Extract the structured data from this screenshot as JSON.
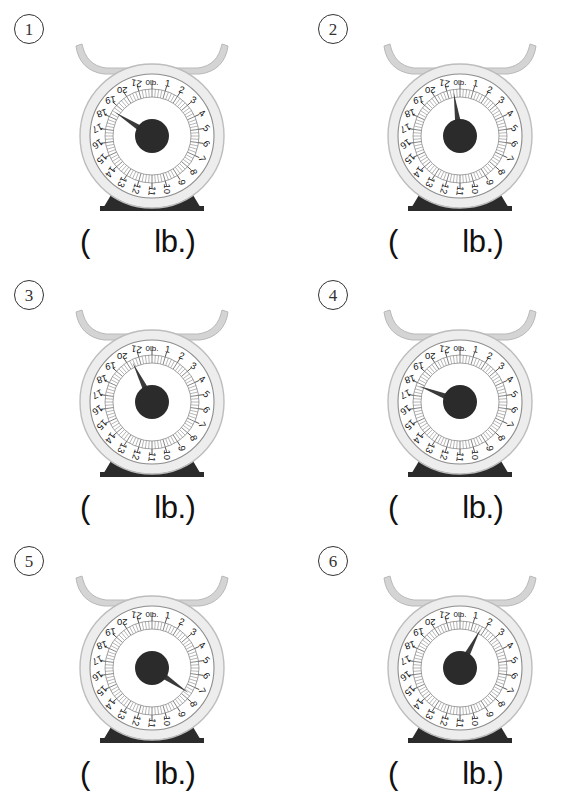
{
  "page": {
    "background": "#ffffff",
    "width": 584,
    "height": 798
  },
  "dial": {
    "unit_label": "0lb.",
    "max_value": 22,
    "tick_labels": [
      "1",
      "2",
      "3",
      "4",
      "5",
      "6",
      "7",
      "8",
      "9",
      "10",
      "11",
      "12",
      "13",
      "14",
      "15",
      "16",
      "17",
      "18",
      "19",
      "20",
      "21"
    ],
    "minor_ticks_per_unit": 4,
    "face_color": "#ffffff",
    "rim_color": "#cfcfcf",
    "needle_color": "#3a3a3a",
    "hub_color": "#2b2b2b",
    "pan_color": "#d4d4d4",
    "base_color": "#2b2b2b"
  },
  "answer": {
    "open_paren": "(",
    "unit": "lb.)"
  },
  "problems": [
    {
      "number": "1",
      "circled_number": "①",
      "needle_value": 18.5,
      "column": "left",
      "row": 0
    },
    {
      "number": "2",
      "circled_number": "②",
      "needle_value": 21.5,
      "column": "right",
      "row": 0
    },
    {
      "number": "3",
      "circled_number": "③",
      "needle_value": 20.4,
      "column": "left",
      "row": 1
    },
    {
      "number": "4",
      "circled_number": "④",
      "needle_value": 17.8,
      "column": "right",
      "row": 1
    },
    {
      "number": "5",
      "circled_number": "⑤",
      "needle_value": 7.6,
      "column": "left",
      "row": 2
    },
    {
      "number": "6",
      "circled_number": "⑥",
      "needle_value": 1.7,
      "column": "right",
      "row": 2
    }
  ]
}
